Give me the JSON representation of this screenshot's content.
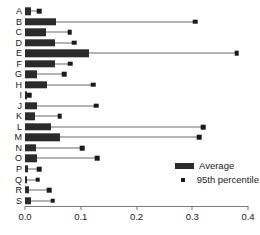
{
  "chart_data": {
    "type": "bar",
    "orientation": "horizontal",
    "title": "",
    "subtitle": "",
    "xlabel": "",
    "ylabel": "",
    "xlim": [
      0.0,
      0.4
    ],
    "ylim": null,
    "grid": false,
    "legend_position": "bottom-right",
    "xticks": [
      0.0,
      0.1,
      0.2,
      0.3,
      0.4
    ],
    "xticklabels": [
      "0.0",
      "0.1",
      "0.2",
      "0.3",
      "0.4"
    ],
    "categories": [
      "A",
      "B",
      "C",
      "D",
      "E",
      "F",
      "G",
      "H",
      "I",
      "J",
      "K",
      "L",
      "M",
      "N",
      "O",
      "P",
      "Q",
      "R",
      "S"
    ],
    "series": [
      {
        "name": "Average",
        "key": "average",
        "color": "#2b2b2b",
        "values": [
          0.01,
          0.055,
          0.038,
          0.053,
          0.115,
          0.053,
          0.022,
          0.04,
          0.004,
          0.022,
          0.018,
          0.046,
          0.062,
          0.02,
          0.021,
          0.006,
          0.003,
          0.008,
          0.01
        ]
      },
      {
        "name": "95th percentile",
        "key": "p95",
        "color": "#1a1a1a",
        "values": [
          0.026,
          0.305,
          0.08,
          0.088,
          0.38,
          0.081,
          0.07,
          0.122,
          0.008,
          0.128,
          0.062,
          0.32,
          0.313,
          0.103,
          0.13,
          0.026,
          0.023,
          0.043,
          0.05
        ]
      }
    ]
  },
  "legend": {
    "entries": [
      {
        "label": "Average",
        "glyph": "bar-swatch"
      },
      {
        "label": "95th percentile",
        "glyph": "square-marker"
      }
    ]
  },
  "colors": {
    "average_bar": "#2b2b2b",
    "percentile_marker": "#1a1a1a",
    "whisker_line": "#6b6b6b",
    "axis": "#7a7a7a",
    "text": "#1a1a1a",
    "background": "#ffffff"
  }
}
